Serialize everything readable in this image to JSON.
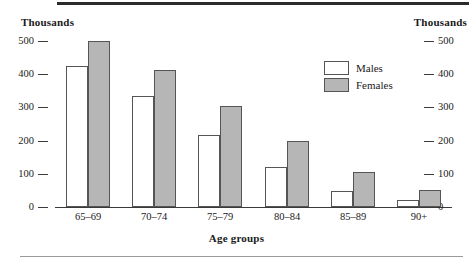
{
  "chart_data": {
    "type": "bar",
    "title": "",
    "xlabel": "Age groups",
    "ylabel": "Thousands",
    "unit_label_left": "Thousands",
    "unit_label_right": "Thousands",
    "categories": [
      "65–69",
      "70–74",
      "75–79",
      "80–84",
      "85–89",
      "90+"
    ],
    "series": [
      {
        "name": "Males",
        "color": "#ffffff",
        "values": [
          425,
          333,
          217,
          120,
          48,
          20
        ]
      },
      {
        "name": "Females",
        "color": "#b6b6b6",
        "values": [
          500,
          412,
          303,
          200,
          105,
          52
        ]
      }
    ],
    "ylim": [
      0,
      500
    ],
    "yticks": [
      0,
      100,
      200,
      300,
      400,
      500
    ],
    "ytick_labels": [
      "0",
      "100",
      "200",
      "300",
      "400",
      "500"
    ],
    "grid": false,
    "legend_position": "upper-right-inside",
    "axis_right_mirrored": true
  },
  "legend": {
    "items": [
      {
        "label": "Males",
        "swatch": "white-square"
      },
      {
        "label": "Females",
        "swatch": "gray-square"
      }
    ]
  },
  "colors": {
    "male_fill": "#ffffff",
    "female_fill": "#b6b6b6",
    "bar_stroke": "#555555",
    "axis": "#3a3a3a",
    "text": "#1a1a1a",
    "rule_top": "#2b2b2b",
    "rule_bottom": "#9a9a9a"
  }
}
